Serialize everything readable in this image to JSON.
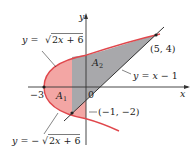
{
  "diagram": {
    "colors": {
      "curve": "#e0474c",
      "region_A1_fill": "#f3a6a4",
      "region_A2_fill": "#a8a8ab",
      "line": "#333333",
      "axis": "#333333",
      "background": "#ffffff"
    },
    "axes": {
      "x_label": "x",
      "y_label": "y",
      "origin_label": "0",
      "tick_neg3_label": "−3"
    },
    "curves": {
      "upper": "y = √2x + 6",
      "upper_prefix": "y = ",
      "upper_radicand": "2x + 6",
      "lower_prefix": "y = −",
      "lower_radicand": "2x + 6",
      "line": "y = x − 1"
    },
    "regions": {
      "A1": "A",
      "A1_sub": "1",
      "A2": "A",
      "A2_sub": "2"
    },
    "points": [
      {
        "label": "(5, 4)",
        "x": 5,
        "y": 4
      },
      {
        "label": "(−1, −2)",
        "x": -1,
        "y": -2
      },
      {
        "label": "−3",
        "x": -3,
        "y": 0
      }
    ]
  }
}
